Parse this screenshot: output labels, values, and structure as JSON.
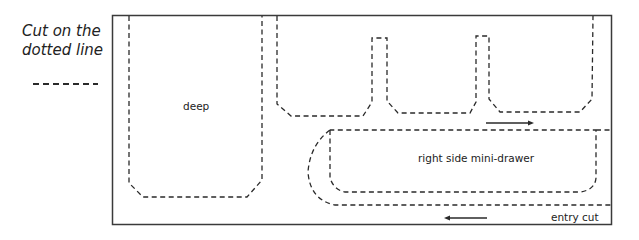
{
  "legend": {
    "text_line1": "Cut on the",
    "text_line2": "dotted line"
  },
  "labels": {
    "deep": "deep",
    "mini_drawer": "right side mini-drawer",
    "entry_cut": "entry cut"
  },
  "colors": {
    "line": "#2a2a2a",
    "border": "#3a3a3a",
    "background": "#ffffff"
  }
}
